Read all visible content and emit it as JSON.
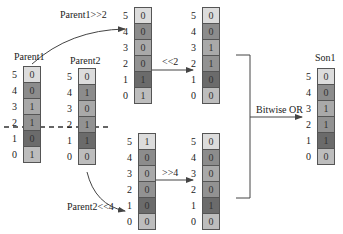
{
  "registers": {
    "parent1": {
      "title": "Parent1",
      "bits": [
        "0",
        "0",
        "1",
        "1",
        "0",
        "1"
      ]
    },
    "parent2": {
      "title": "Parent2",
      "bits": [
        "0",
        "1",
        "0",
        "1",
        "1",
        "0"
      ]
    },
    "p1_shr2": {
      "bits": [
        "0",
        "0",
        "0",
        "0",
        "1",
        "1"
      ]
    },
    "p1_shr2_shl2": {
      "bits": [
        "0",
        "0",
        "1",
        "1",
        "0",
        "0"
      ]
    },
    "p2_shl4": {
      "bits": [
        "1",
        "0",
        "0",
        "0",
        "0",
        "0"
      ]
    },
    "p2_shl4_shr4": {
      "bits": [
        "0",
        "0",
        "0",
        "0",
        "1",
        "0"
      ]
    },
    "son1": {
      "title": "Son1",
      "bits": [
        "0",
        "0",
        "1",
        "1",
        "1",
        "0"
      ]
    }
  },
  "indices": [
    "5",
    "4",
    "3",
    "2",
    "1",
    "0"
  ],
  "labels": {
    "parent1_shift": "Parent1>>2",
    "shl2": "<<2",
    "parent2_shift": "Parent2<<4",
    "shr4": ">>4",
    "or": "Bitwise OR"
  },
  "colors": {
    "row5": "#dcdcdc",
    "row4": "#8c8c8c",
    "row3": "#a9a9a9",
    "row2": "#929292",
    "row1": "#6b6b6b",
    "row0": "#bdbdbd"
  }
}
